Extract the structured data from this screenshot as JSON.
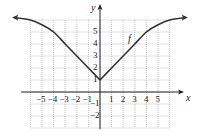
{
  "chart_data": {
    "type": "line",
    "title": "",
    "xlabel": "x",
    "ylabel": "y",
    "xlim": [
      -6,
      6
    ],
    "ylim": [
      -3,
      6
    ],
    "grid": true,
    "x_ticks": [
      "-5",
      "-4",
      "-3",
      "-2",
      "-1",
      "1",
      "2",
      "3",
      "4",
      "5"
    ],
    "y_ticks": [
      "-2",
      "-1",
      "1",
      "2",
      "3",
      "4",
      "5"
    ],
    "series": [
      {
        "name": "f",
        "x": [
          -7.4,
          -6,
          -5,
          -4,
          -3,
          -2,
          -1,
          0,
          1,
          2,
          3,
          4,
          5,
          6,
          7.4
        ],
        "y": [
          6.2,
          6.0,
          5.6,
          5.0,
          4.0,
          3.0,
          2.0,
          1.0,
          2.0,
          3.0,
          4.0,
          5.0,
          5.6,
          6.0,
          6.2
        ]
      }
    ],
    "annotations": [
      "f"
    ]
  },
  "labels": {
    "x_axis": "x",
    "y_axis": "y",
    "curve": "f"
  },
  "colors": {
    "curve": "#333333",
    "axis": "#222222",
    "grid": "#9a9a9a"
  }
}
